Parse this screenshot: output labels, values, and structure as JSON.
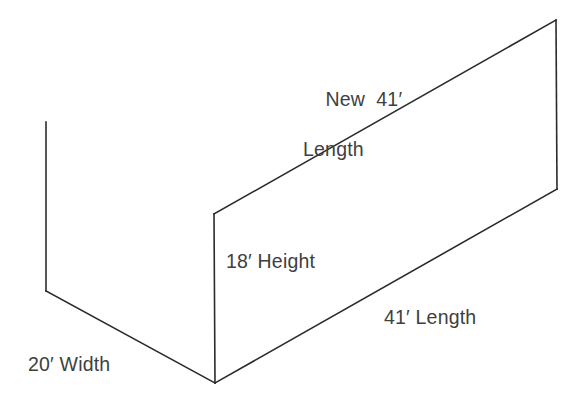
{
  "diagram": {
    "type": "isometric-wall-dimension-diagram",
    "background_color": "#ffffff",
    "line_color": "#2b2b2b",
    "text_color": "#404040",
    "labels": {
      "new_length_line1": "New  41′",
      "new_length_line2": "Length",
      "height": "18′ Height",
      "length": "41′ Length",
      "width": "20′ Width"
    },
    "measurements": [
      {
        "name": "new-length",
        "value": 41,
        "unit": "ft",
        "text": "New  41′ Length"
      },
      {
        "name": "height",
        "value": 18,
        "unit": "ft",
        "text": "18′ Height"
      },
      {
        "name": "length",
        "value": 41,
        "unit": "ft",
        "text": "41′ Length"
      },
      {
        "name": "width",
        "value": 20,
        "unit": "ft",
        "text": "20′ Width"
      }
    ],
    "geometry": {
      "back_wall_edge": "M 46 122 L 46 291",
      "floor_width_edge": "M 46 291 L 215 383",
      "near_vertical_height_edge": "M 214 214 L 215 383",
      "top_new_length_edge": "M 214 214 L 556 20",
      "far_right_vertical_edge": "M 556 20 L 557 189",
      "bottom_length_edge": "M 557 189 L 215 383"
    }
  }
}
